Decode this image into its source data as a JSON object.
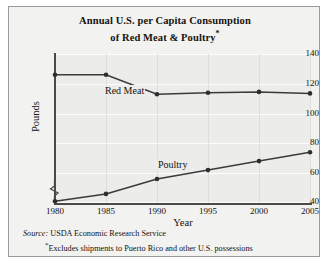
{
  "chart_data": {
    "type": "line",
    "title": "Annual U.S. per Capita Consumption of Red Meat & Poultry",
    "title_line1": "Annual U.S. per Capita Consumption",
    "title_line2": "of Red Meat & Poultry",
    "title_asterisk": "*",
    "xlabel": "Year",
    "ylabel": "Pounds",
    "x": [
      1980,
      1985,
      1990,
      1995,
      2000,
      2005
    ],
    "xticklabels": [
      "1980",
      "1985",
      "1990",
      "1995",
      "2000",
      "2005"
    ],
    "yticklabels": [
      "140",
      "120",
      "100",
      "80",
      "60",
      "40"
    ],
    "yticks": [
      140,
      120,
      100,
      80,
      60,
      40
    ],
    "ylim": [
      35,
      145
    ],
    "xlim": [
      1980,
      2005
    ],
    "axis_break": true,
    "grid": true,
    "legend": "inline-labels",
    "series": [
      {
        "name": "Red Meat",
        "label": "Red Meat",
        "color": "#3b3b3b",
        "values": [
          126,
          126,
          113,
          114,
          114.5,
          113.5
        ]
      },
      {
        "name": "Poultry",
        "label": "Poultry",
        "color": "#3b3b3b",
        "values": [
          41,
          46,
          56,
          62,
          68,
          74
        ]
      }
    ]
  },
  "source": {
    "label": "Source:",
    "text": "USDA Economic Research Service",
    "asterisk": "*",
    "note": "Excludes shipments to Puerto Rico and other U.S. possessions"
  }
}
